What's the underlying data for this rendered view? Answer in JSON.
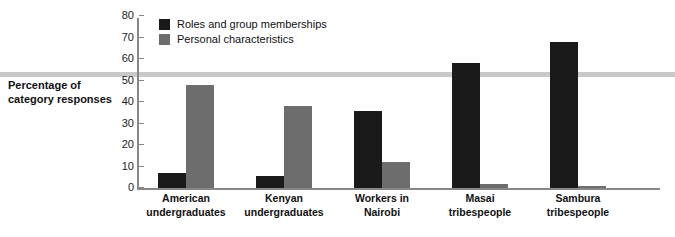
{
  "chart_data": {
    "type": "bar",
    "title": "",
    "xlabel": "",
    "ylabel": "Percentage of category responses",
    "ylim": [
      0,
      80
    ],
    "yticks": [
      0,
      10,
      20,
      30,
      40,
      50,
      60,
      70,
      80
    ],
    "grid": false,
    "legend_position": "top-left inside plot",
    "categories": [
      "American undergraduates",
      "Kenyan undergraduates",
      "Workers in Nairobi",
      "Masai tribespeople",
      "Sambura tribespeople"
    ],
    "series": [
      {
        "name": "Roles and group memberships",
        "color": "#1a1a1a",
        "values": [
          7,
          5.5,
          36,
          58,
          68
        ]
      },
      {
        "name": "Personal characteristics",
        "color": "#6d6d6d",
        "values": [
          48,
          38,
          12,
          2,
          1
        ]
      }
    ]
  },
  "axis": {
    "y_title_line1": "Percentage of",
    "y_title_line2": "category responses"
  },
  "legend": {
    "items": [
      {
        "label": "Roles and group memberships",
        "color": "#1a1a1a"
      },
      {
        "label": "Personal characteristics",
        "color": "#6d6d6d"
      }
    ]
  },
  "categories_wrapped": [
    {
      "line1": "American",
      "line2": "undergraduates"
    },
    {
      "line1": "Kenyan",
      "line2": "undergraduates"
    },
    {
      "line1": "Workers in",
      "line2": "Nairobi"
    },
    {
      "line1": "Masai",
      "line2": "tribespeople"
    },
    {
      "line1": "Sambura",
      "line2": "tribespeople"
    }
  ],
  "colors": {
    "roles": "#1a1a1a",
    "personal": "#6d6d6d",
    "axis": "#878787",
    "rule": "#c9c9c9",
    "text": "#111111"
  }
}
